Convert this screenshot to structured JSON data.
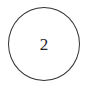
{
  "node": {
    "label": "2",
    "shape": "circle",
    "border_color": "#333333",
    "text_color": "#222222"
  }
}
